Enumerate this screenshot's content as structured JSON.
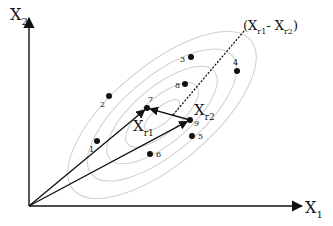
{
  "diagram": {
    "type": "vector-diagram",
    "axes": {
      "x_label": "X",
      "x_sub": "1",
      "y_label": "X",
      "y_sub": "2",
      "origin": [
        29,
        206
      ],
      "x_end": [
        302,
        206
      ],
      "y_end": [
        29,
        18
      ]
    },
    "ellipses": {
      "center": [
        162,
        115
      ],
      "rotation_deg": -40,
      "color": "#cfcfcf",
      "radii": [
        [
          22,
          8
        ],
        [
          45,
          18
        ],
        [
          68,
          28
        ],
        [
          92,
          38
        ],
        [
          116,
          49
        ]
      ]
    },
    "points": [
      {
        "id": "1",
        "x": 97,
        "y": 141,
        "lx": 89,
        "ly": 152
      },
      {
        "id": "2",
        "x": 109,
        "y": 96,
        "lx": 100,
        "ly": 107
      },
      {
        "id": "3",
        "x": 191,
        "y": 57,
        "lx": 180,
        "ly": 62
      },
      {
        "id": "4",
        "x": 237,
        "y": 71,
        "lx": 233,
        "ly": 65
      },
      {
        "id": "5",
        "x": 192,
        "y": 136,
        "lx": 198,
        "ly": 139
      },
      {
        "id": "6",
        "x": 150,
        "y": 154,
        "lx": 156,
        "ly": 157
      },
      {
        "id": "7",
        "x": 147,
        "y": 108,
        "lx": 148,
        "ly": 102
      },
      {
        "id": "8",
        "x": 185,
        "y": 84,
        "lx": 175,
        "ly": 88
      },
      {
        "id": "9",
        "x": 190,
        "y": 120,
        "lx": 194,
        "ly": 126
      }
    ],
    "vectors": {
      "xr1": {
        "label": "X",
        "sub": "r1",
        "from": [
          29,
          206
        ],
        "to": [
          147,
          108
        ],
        "lx": 133,
        "ly": 131
      },
      "xr2": {
        "label": "X",
        "sub": "r2",
        "from": [
          29,
          206
        ],
        "to": [
          190,
          120
        ],
        "lx": 194,
        "ly": 115
      },
      "diff": {
        "from": [
          190,
          120
        ],
        "to": [
          147,
          108
        ]
      }
    },
    "difference_line": {
      "from": [
        173,
        115
      ],
      "to": [
        244,
        31
      ],
      "label_open": "(X",
      "label_sub1": "r1",
      "label_mid": "- X",
      "label_sub2": "r2",
      "label_close": ")",
      "lx": 243,
      "ly": 30
    }
  }
}
